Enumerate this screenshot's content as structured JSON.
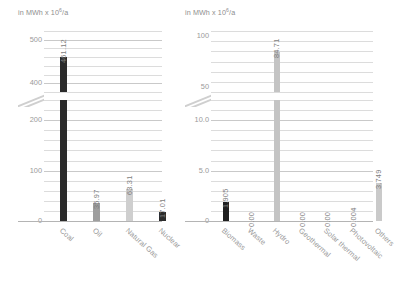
{
  "chart_data": [
    {
      "type": "bar",
      "title": "",
      "unit_label": "in MWh x 10",
      "unit_exponent": "6",
      "unit_suffix": "/a",
      "xlabel": "",
      "ylabel": "in MWh x 10^6/a",
      "grid": true,
      "legend": null,
      "axis_break": true,
      "ylim_lower": [
        0,
        240
      ],
      "ylim_upper": [
        380,
        520
      ],
      "ticks_lower": [
        "0",
        "100",
        "200"
      ],
      "ticks_upper": [
        "400",
        "500"
      ],
      "tick_values_lower": [
        0,
        100,
        200
      ],
      "tick_values_upper": [
        400,
        500
      ],
      "minor_tick_step_lower": 20,
      "minor_tick_step_upper": 20,
      "categories": [
        "Coal",
        "Oil",
        "Natural Gas",
        "Nuclear"
      ],
      "values": [
        461.12,
        35.97,
        63.31,
        17.01
      ],
      "value_labels": [
        "461.12",
        "35.97",
        "63.31",
        "17.01"
      ],
      "bar_colors": [
        "#2b2b2b",
        "#9e9e9e",
        "#cfcfcf",
        "#2b2b2b"
      ]
    },
    {
      "type": "bar",
      "title": "",
      "unit_label": "in MWh x 10",
      "unit_exponent": "6",
      "unit_suffix": "/a",
      "xlabel": "",
      "ylabel": "in MWh x 10^6/a",
      "grid": true,
      "legend": null,
      "axis_break": true,
      "ylim_lower": [
        0,
        12
      ],
      "ylim_upper": [
        45,
        105
      ],
      "ticks_lower": [
        "0",
        "5.0",
        "10.0"
      ],
      "ticks_upper": [
        "50",
        "100"
      ],
      "tick_values_lower": [
        0,
        5,
        10
      ],
      "tick_values_upper": [
        50,
        100
      ],
      "minor_tick_step_lower": 1,
      "minor_tick_step_upper": 10,
      "categories": [
        "Biomass",
        "Waste",
        "Hydro",
        "Geothermal",
        "Solar thermal",
        "Photovoltaic",
        "Others"
      ],
      "values": [
        1.905,
        0.0,
        84.71,
        0.0,
        0.0,
        0.004,
        3.749
      ],
      "value_labels": [
        "1.905",
        "0.00",
        "84.71",
        "0.00",
        "0.00",
        "0.004",
        "3.749"
      ],
      "bar_colors": [
        "#1f1f1f",
        "#c4c4c4",
        "#c4c4c4",
        "#c4c4c4",
        "#c4c4c4",
        "#c4c4c4",
        "#cacaca"
      ]
    }
  ],
  "colors": {
    "grid": "#dcdcdc",
    "grid_major": "#c9c9c9",
    "axis": "#b4b4b4",
    "text": "#9a9a9a",
    "value_text": "#7d7d7d",
    "background": "#ffffff"
  }
}
